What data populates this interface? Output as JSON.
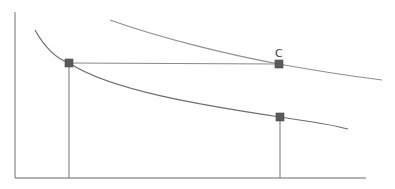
{
  "diagram": {
    "axes": {
      "origin": [
        15,
        178
      ],
      "y_top": [
        15,
        12
      ],
      "x_end": [
        366,
        178
      ]
    },
    "curves": [
      {
        "name": "upper-curve",
        "path": "M110,20 C160,38 230,55 279,64 S350,76 382,80"
      },
      {
        "name": "lower-curve",
        "path": "M35,30 C45,48 55,58 69,63 C110,90 200,105 280,117 S330,126 348,129"
      }
    ],
    "points": [
      {
        "name": "point-left",
        "x": 69,
        "y": 63,
        "label": ""
      },
      {
        "name": "point-c",
        "x": 279,
        "y": 64,
        "label": "C"
      },
      {
        "name": "point-lower-right",
        "x": 280,
        "y": 117,
        "label": ""
      }
    ],
    "guides": [
      {
        "name": "horizontal-guide",
        "x1": 69,
        "y1": 63,
        "x2": 279,
        "y2": 64
      },
      {
        "name": "vertical-guide-left",
        "x1": 69,
        "y1": 63,
        "x2": 69,
        "y2": 178
      },
      {
        "name": "vertical-guide-right",
        "x1": 280,
        "y1": 117,
        "x2": 280,
        "y2": 178
      }
    ],
    "labels": {
      "c": "C"
    }
  }
}
